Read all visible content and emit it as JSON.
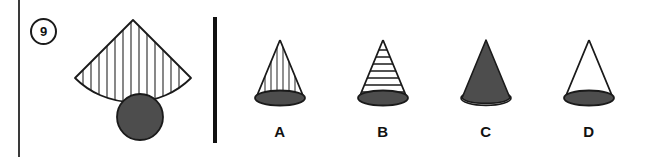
{
  "page": {
    "width": 652,
    "height": 157,
    "background": "#ffffff"
  },
  "question": {
    "number": "9",
    "number_style": "circled",
    "prompt_figure": {
      "name": "cone-net",
      "parts": [
        {
          "shape": "circular-sector",
          "fill": "#ffffff",
          "stroke": "#1a1a1a",
          "hatching": "vertical-lines",
          "hatch_color": "#4a4a4a"
        },
        {
          "shape": "circle",
          "fill": "#4d4d4d",
          "stroke": "#1a1a1a"
        }
      ]
    }
  },
  "divider": {
    "name": "section-divider",
    "color": "#111111"
  },
  "options": [
    {
      "label": "A",
      "figure": "cone",
      "body_fill": "#ffffff",
      "body_pattern": "vertical-lines",
      "pattern_color": "#555555",
      "base_fill": "#4d4d4d",
      "stroke": "#1a1a1a"
    },
    {
      "label": "B",
      "figure": "cone",
      "body_fill": "#ffffff",
      "body_pattern": "horizontal-lines",
      "pattern_color": "#1a1a1a",
      "base_fill": "#4d4d4d",
      "stroke": "#1a1a1a"
    },
    {
      "label": "C",
      "figure": "cone",
      "body_fill": "#4d4d4d",
      "body_pattern": "solid",
      "pattern_color": "#4d4d4d",
      "base_fill": "#bfbfbf",
      "stroke": "#1a1a1a"
    },
    {
      "label": "D",
      "figure": "cone",
      "body_fill": "#ffffff",
      "body_pattern": "none",
      "pattern_color": "#ffffff",
      "base_fill": "#4d4d4d",
      "stroke": "#1a1a1a"
    }
  ]
}
